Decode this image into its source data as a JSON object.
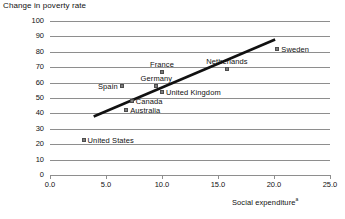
{
  "chart_data": {
    "type": "scatter",
    "title": "",
    "ylabel": "Change in poverty rate",
    "xlabel": "Social expenditureᵃ",
    "xlabel_text": "Social expenditure",
    "xlabel_footnote_marker": "a",
    "xlim": [
      0.0,
      25.0
    ],
    "ylim": [
      0,
      100
    ],
    "xticks": [
      "0.0",
      "5.0",
      "10.0",
      "15.0",
      "20.0",
      "25.0"
    ],
    "xtick_values": [
      0.0,
      5.0,
      10.0,
      15.0,
      20.0,
      25.0
    ],
    "yticks": [
      "0",
      "10",
      "20",
      "30",
      "40",
      "50",
      "60",
      "70",
      "80",
      "90",
      "100"
    ],
    "ytick_values": [
      0,
      10,
      20,
      30,
      40,
      50,
      60,
      70,
      80,
      90,
      100
    ],
    "grid": true,
    "grid_axis": "y",
    "legend": "none",
    "marker_color": "#7d7d7d",
    "gridline_color": "#8e8e8e",
    "trendline_color": "#111111",
    "points": [
      {
        "label": "United States",
        "x": 3.0,
        "y": 23,
        "label_side": "right"
      },
      {
        "label": "Australia",
        "x": 6.8,
        "y": 42,
        "label_side": "right"
      },
      {
        "label": "Canada",
        "x": 7.3,
        "y": 48,
        "label_side": "right"
      },
      {
        "label": "Spain",
        "x": 6.4,
        "y": 58,
        "label_side": "left"
      },
      {
        "label": "Germany",
        "x": 9.5,
        "y": 58,
        "label_side": "above"
      },
      {
        "label": "United Kingdom",
        "x": 10.0,
        "y": 54,
        "label_side": "right"
      },
      {
        "label": "France",
        "x": 10.0,
        "y": 67,
        "label_side": "above"
      },
      {
        "label": "Netherlands",
        "x": 15.8,
        "y": 69,
        "label_side": "above"
      },
      {
        "label": "Sweden",
        "x": 20.3,
        "y": 82,
        "label_side": "right"
      }
    ],
    "trendline": {
      "x0": 3.9,
      "y0": 38,
      "x1": 20.1,
      "y1": 88
    }
  }
}
